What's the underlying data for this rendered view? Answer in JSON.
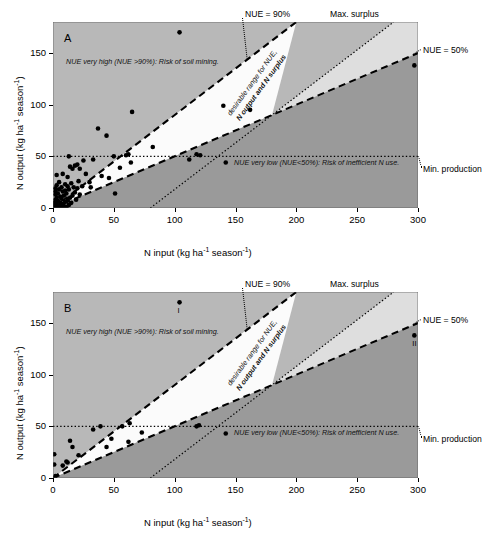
{
  "figure": {
    "panels": [
      {
        "letter": "A"
      },
      {
        "letter": "B"
      }
    ],
    "axes": {
      "xlabel_main": "N input (kg ha",
      "xlabel_sup1": "-1",
      "xlabel_mid": " season",
      "xlabel_sup2": "-1",
      "xlabel_end": ")",
      "ylabel_main": "N output (kg ha",
      "ylabel_sup1": "-1",
      "ylabel_mid": " season",
      "ylabel_sup2": "-1",
      "ylabel_end": ")",
      "xticks": [
        "0",
        "50",
        "100",
        "150",
        "200",
        "250",
        "300"
      ],
      "yticks": [
        "0",
        "50",
        "100",
        "150"
      ]
    },
    "annotations": {
      "nue90": "NUE = 90%",
      "nue50": "NUE = 50%",
      "max_surplus": "Max. surplus",
      "min_production": "Min. production",
      "high_zone": "NUE very high (NUE >90%): Risk of soil mining.",
      "low_zone": "NUE very low (NUE<50%): Risk of inefficient N use.",
      "desirable_line1": "desirable range for NUE,",
      "desirable_line2": "N output and N surplus",
      "point_label_I": "I",
      "point_label_II": "II"
    },
    "colors": {
      "zone_above_nue90": "#b8b8b8",
      "zone_desirable": "#fbfbfb",
      "zone_light_wedge": "#dedede",
      "zone_below_nue50": "#9a9a9a",
      "line": "#000000",
      "marker": "#000000",
      "background": "#ffffff"
    }
  },
  "chart_data": [
    {
      "type": "scatter",
      "panel": "A",
      "title": "A",
      "xlabel": "N input (kg ha-1 season-1)",
      "ylabel": "N output (kg ha-1 season-1)",
      "xlim": [
        0,
        300
      ],
      "ylim": [
        0,
        180
      ],
      "xticks": [
        0,
        50,
        100,
        150,
        200,
        250,
        300
      ],
      "yticks": [
        0,
        50,
        100,
        150
      ],
      "grid": false,
      "legend": "none",
      "reference_lines": [
        {
          "name": "NUE = 90%",
          "type": "dashed",
          "slope": 0.9,
          "intercept": 0
        },
        {
          "name": "NUE = 50%",
          "type": "dashed",
          "slope": 0.5,
          "intercept": 0
        },
        {
          "name": "Max. surplus",
          "type": "dotted",
          "slope": 0.9,
          "intercept": -72
        },
        {
          "name": "Min. production",
          "type": "dotted",
          "slope": 0,
          "intercept": 50
        }
      ],
      "points": [
        [
          1,
          0
        ],
        [
          1,
          2
        ],
        [
          1,
          5
        ],
        [
          2,
          8
        ],
        [
          2,
          13
        ],
        [
          2,
          16
        ],
        [
          2,
          19
        ],
        [
          3,
          1
        ],
        [
          3,
          4
        ],
        [
          3,
          10
        ],
        [
          3,
          22
        ],
        [
          3,
          32
        ],
        [
          4,
          0
        ],
        [
          4,
          7
        ],
        [
          4,
          14
        ],
        [
          5,
          2
        ],
        [
          5,
          18
        ],
        [
          5,
          25
        ],
        [
          6,
          5
        ],
        [
          6,
          11
        ],
        [
          7,
          1
        ],
        [
          7,
          9
        ],
        [
          7,
          20
        ],
        [
          8,
          4
        ],
        [
          8,
          16
        ],
        [
          8,
          33
        ],
        [
          9,
          2
        ],
        [
          9,
          12
        ],
        [
          10,
          6
        ],
        [
          10,
          17
        ],
        [
          10,
          23
        ],
        [
          11,
          1
        ],
        [
          11,
          14
        ],
        [
          12,
          8
        ],
        [
          12,
          21
        ],
        [
          12,
          30
        ],
        [
          13,
          3
        ],
        [
          13,
          18
        ],
        [
          13,
          50
        ],
        [
          14,
          10
        ],
        [
          14,
          40
        ],
        [
          15,
          5
        ],
        [
          15,
          24
        ],
        [
          16,
          12
        ],
        [
          16,
          38
        ],
        [
          17,
          20
        ],
        [
          18,
          15
        ],
        [
          18,
          41
        ],
        [
          19,
          8
        ],
        [
          20,
          19
        ],
        [
          20,
          42
        ],
        [
          21,
          26
        ],
        [
          22,
          13
        ],
        [
          22,
          38
        ],
        [
          24,
          21
        ],
        [
          25,
          46
        ],
        [
          27,
          33
        ],
        [
          30,
          25
        ],
        [
          31,
          20
        ],
        [
          33,
          47
        ],
        [
          37,
          77
        ],
        [
          40,
          31
        ],
        [
          44,
          70
        ],
        [
          46,
          29
        ],
        [
          50,
          50
        ],
        [
          51,
          14
        ],
        [
          55,
          39
        ],
        [
          60,
          51
        ],
        [
          62,
          52
        ],
        [
          64,
          44
        ],
        [
          65,
          93
        ],
        [
          82,
          59
        ],
        [
          104,
          170
        ],
        [
          112,
          47
        ],
        [
          118,
          52
        ],
        [
          121,
          51
        ],
        [
          140,
          99
        ],
        [
          142,
          44
        ],
        [
          162,
          95
        ],
        [
          297,
          138
        ]
      ]
    },
    {
      "type": "scatter",
      "panel": "B",
      "title": "B",
      "xlabel": "N input (kg ha-1 season-1)",
      "ylabel": "N output (kg ha-1 season-1)",
      "xlim": [
        0,
        300
      ],
      "ylim": [
        0,
        180
      ],
      "xticks": [
        0,
        50,
        100,
        150,
        200,
        250,
        300
      ],
      "yticks": [
        0,
        50,
        100,
        150
      ],
      "grid": false,
      "legend": "none",
      "reference_lines": [
        {
          "name": "NUE = 90%",
          "type": "dashed",
          "slope": 0.9,
          "intercept": 0
        },
        {
          "name": "NUE = 50%",
          "type": "dashed",
          "slope": 0.5,
          "intercept": 0
        },
        {
          "name": "Max. surplus",
          "type": "dotted",
          "slope": 0.9,
          "intercept": -72
        },
        {
          "name": "Min. production",
          "type": "dotted",
          "slope": 0,
          "intercept": 50
        }
      ],
      "points": [
        [
          1,
          23
        ],
        [
          1,
          13
        ],
        [
          2,
          2
        ],
        [
          8,
          12
        ],
        [
          11,
          16
        ],
        [
          12,
          15
        ],
        [
          14,
          36
        ],
        [
          16,
          30
        ],
        [
          21,
          22
        ],
        [
          33,
          47
        ],
        [
          39,
          50
        ],
        [
          44,
          30
        ],
        [
          48,
          38
        ],
        [
          57,
          50
        ],
        [
          62,
          35
        ],
        [
          63,
          53
        ],
        [
          73,
          44
        ],
        [
          104,
          170
        ],
        [
          118,
          50
        ],
        [
          120,
          51
        ],
        [
          142,
          43
        ],
        [
          297,
          138
        ]
      ],
      "point_annotations": [
        {
          "label": "I",
          "x": 104,
          "y": 170
        },
        {
          "label": "II",
          "x": 297,
          "y": 138
        }
      ]
    }
  ]
}
